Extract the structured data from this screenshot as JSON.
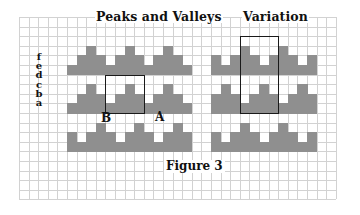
{
  "figure": {
    "caption": "Figure 3",
    "grid": {
      "cell_px": 9.6,
      "columns": 33,
      "rows": 19,
      "line_color": "#d2d2d2",
      "fill_color": "#8f8f8f"
    },
    "panels": [
      {
        "title": "Peaks and Valleys",
        "row_labels": [
          "f",
          "e",
          "d",
          "c",
          "b",
          "a"
        ],
        "points": [
          {
            "label": "B"
          },
          {
            "label": "A"
          }
        ],
        "bands": [
          {
            "top_row": 3,
            "peaks": [
              7,
              11,
              15
            ],
            "gaps": [
              5,
              9,
              13,
              17
            ],
            "full": [
              5,
              17
            ]
          },
          {
            "top_row": 7,
            "peaks": [
              7,
              11,
              15
            ],
            "gaps": [
              5,
              9,
              13,
              17
            ],
            "full": [
              5,
              17
            ]
          },
          {
            "top_row": 11,
            "peaks": [
              8,
              12,
              16
            ],
            "gaps": [
              6,
              10,
              14
            ],
            "full": [
              5,
              17
            ]
          }
        ],
        "highlight_box": {
          "col": 9,
          "row": 6,
          "cols": 4,
          "rows": 4
        }
      },
      {
        "title": "Variation",
        "bands": [
          {
            "top_row": 3,
            "peaks": [
              23,
              27
            ],
            "gaps": [
              21,
              25,
              29
            ],
            "full": [
              20,
              30
            ]
          },
          {
            "top_row": 7,
            "peaks": [
              21,
              25,
              29
            ],
            "gaps": [
              23,
              27
            ],
            "full": [
              20,
              30
            ]
          },
          {
            "top_row": 11,
            "peaks": [
              23,
              27
            ],
            "gaps": [
              21,
              25,
              29
            ],
            "full": [
              20,
              30
            ]
          }
        ],
        "highlight_box": {
          "col": 23,
          "row": 2,
          "cols": 4,
          "rows": 8
        }
      }
    ]
  }
}
